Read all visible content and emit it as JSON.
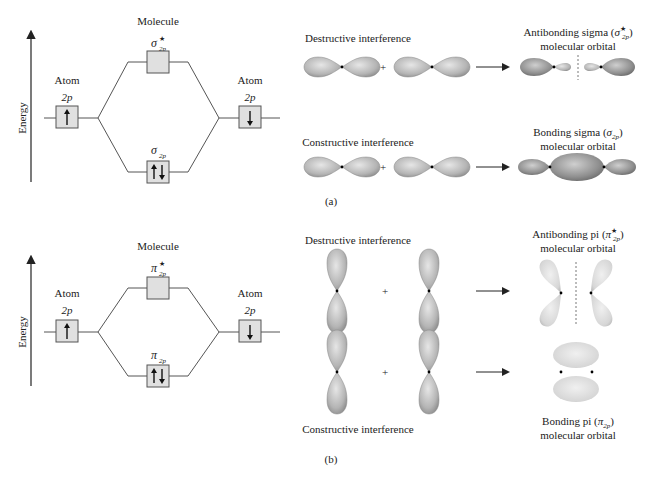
{
  "panel_a": {
    "label": "(a)",
    "energy_axis_label": "Energy",
    "molecule_label": "Molecule",
    "left_atom": {
      "label": "Atom",
      "orbital": "2p",
      "electron": "up"
    },
    "right_atom": {
      "label": "Atom",
      "orbital": "2p",
      "electron": "down"
    },
    "antibonding_level": {
      "symbol": "σ",
      "sub": "2p",
      "sup": "★",
      "electrons": ""
    },
    "bonding_level": {
      "symbol": "σ",
      "sub": "2p",
      "electrons": "up-down"
    },
    "destructive": {
      "title": "Destructive interference",
      "plus": "+",
      "result_line1_prefix": "Antibonding sigma (",
      "result_symbol": "σ",
      "result_sup": "★",
      "result_sub": "2p",
      "result_line1_suffix": ")",
      "result_line2": "molecular orbital"
    },
    "constructive": {
      "title": "Constructive interference",
      "plus": "+",
      "result_line1_prefix": "Bonding sigma (",
      "result_symbol": "σ",
      "result_sub": "2p",
      "result_line1_suffix": ")",
      "result_line2": "molecular orbital"
    }
  },
  "panel_b": {
    "label": "(b)",
    "energy_axis_label": "Energy",
    "molecule_label": "Molecule",
    "left_atom": {
      "label": "Atom",
      "orbital": "2p",
      "electron": "up"
    },
    "right_atom": {
      "label": "Atom",
      "orbital": "2p",
      "electron": "down"
    },
    "antibonding_level": {
      "symbol": "π",
      "sub": "2p",
      "sup": "★",
      "electrons": ""
    },
    "bonding_level": {
      "symbol": "π",
      "sub": "2p",
      "electrons": "up-down"
    },
    "destructive": {
      "title": "Destructive interference",
      "plus": "+",
      "result_line1_prefix": "Antibonding pi (",
      "result_symbol": "π",
      "result_sup": "★",
      "result_sub": "2p",
      "result_line1_suffix": ")",
      "result_line2": "molecular orbital"
    },
    "constructive": {
      "title": "Constructive interference",
      "plus": "+",
      "result_line1_prefix": "Bonding pi (",
      "result_symbol": "π",
      "result_sub": "2p",
      "result_line1_suffix": ")",
      "result_line2": "molecular orbital"
    }
  },
  "colors": {
    "box_fill": "#e0e0e0",
    "line": "#555555",
    "lobe_light": "#d8d8d8",
    "lobe_dark": "#9a9a9a",
    "pi_light": "#e4e4e4"
  }
}
